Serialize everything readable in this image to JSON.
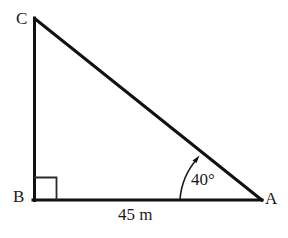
{
  "figure": {
    "type": "right-triangle-diagram",
    "background_color": "#ffffff",
    "stroke_color": "#111111",
    "vertices": {
      "C": {
        "label": "C",
        "x": 34,
        "y": 18
      },
      "B": {
        "label": "B",
        "x": 34,
        "y": 200
      },
      "A": {
        "label": "A",
        "x": 262,
        "y": 200
      }
    },
    "edges": [
      {
        "name": "CB",
        "from": "C",
        "to": "B"
      },
      {
        "name": "BA",
        "from": "B",
        "to": "A"
      },
      {
        "name": "CA",
        "from": "C",
        "to": "A"
      }
    ],
    "right_angle": {
      "at_vertex": "B",
      "marker": "square",
      "size": 22
    },
    "angle_annotation": {
      "at_vertex": "A",
      "label": "40°",
      "value": 40,
      "unit": "degrees",
      "has_arc": true,
      "has_arrowhead": true
    },
    "side_annotation": {
      "edge": "BA",
      "label": "45 m",
      "value": 45,
      "unit": "m"
    }
  }
}
